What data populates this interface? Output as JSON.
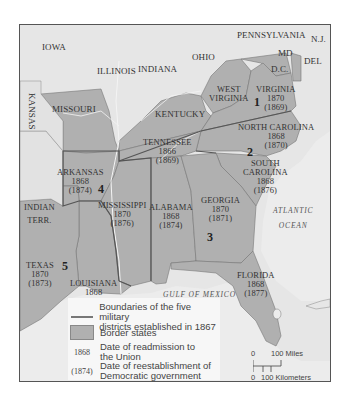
{
  "map": {
    "colors": {
      "border_state_fill": "#b0b0b0",
      "other_state_fill": "#e6e6e6",
      "water": "#ececec",
      "district_boundary": "#555555",
      "river": "#f4f4f4"
    },
    "states": [
      {
        "name": "IOWA"
      },
      {
        "name": "ILLINOIS"
      },
      {
        "name": "INDIANA"
      },
      {
        "name": "OHIO"
      },
      {
        "name": "PENNSYLVANIA"
      },
      {
        "name": "N.J."
      },
      {
        "name": "MD"
      },
      {
        "name": "D.C."
      },
      {
        "name": "DEL"
      },
      {
        "name": "KANSAS"
      },
      {
        "name": "MISSOURI"
      },
      {
        "name": "KENTUCKY"
      },
      {
        "name": "WEST VIRGINIA"
      },
      {
        "name": "INDIAN TERR."
      },
      {
        "name": "VIRGINIA",
        "readmission": "1870",
        "democratic": "(1869)"
      },
      {
        "name": "NORTH CAROLINA",
        "readmission": "1868",
        "democratic": "(1870)"
      },
      {
        "name": "TENNESSEE",
        "readmission": "1866",
        "democratic": "(1869)"
      },
      {
        "name": "SOUTH CAROLINA",
        "readmission": "1868",
        "democratic": "(1876)"
      },
      {
        "name": "ARKANSAS",
        "readmission": "1868",
        "democratic": "(1874)"
      },
      {
        "name": "MISSISSIPPI",
        "readmission": "1870",
        "democratic": "(1876)"
      },
      {
        "name": "ALABAMA",
        "readmission": "1868",
        "democratic": "(1874)"
      },
      {
        "name": "GEORGIA",
        "readmission": "1870",
        "democratic": "(1871)"
      },
      {
        "name": "TEXAS",
        "readmission": "1870",
        "democratic": "(1873)"
      },
      {
        "name": "LOUISIANA",
        "readmission": "1868",
        "democratic": "(1877)"
      },
      {
        "name": "FLORIDA",
        "readmission": "1868",
        "democratic": "(1877)"
      }
    ],
    "labels": {
      "iowa": "IOWA",
      "illinois": "ILLINOIS",
      "indiana": "INDIANA",
      "ohio": "OHIO",
      "pennsylvania": "PENNSYLVANIA",
      "nj": "N.J.",
      "md": "MD",
      "dc": "D.C.",
      "del": "DEL",
      "kansas": "KANSAS",
      "missouri": "MISSOURI",
      "kentucky": "KENTUCKY",
      "west_virginia_1": "WEST",
      "west_virginia_2": "VIRGINIA",
      "indian_terr_1": "INDIAN",
      "indian_terr_2": "TERR.",
      "virginia": "VIRGINIA",
      "virginia_r": "1870",
      "virginia_d": "(1869)",
      "north_carolina": "NORTH CAROLINA",
      "north_carolina_r": "1868",
      "north_carolina_d": "(1870)",
      "tennessee": "TENNESSEE",
      "tennessee_r": "1866",
      "tennessee_d": "(1869)",
      "south_carolina_1": "SOUTH",
      "south_carolina_2": "CAROLINA",
      "south_carolina_r": "1868",
      "south_carolina_d": "(1876)",
      "arkansas": "ARKANSAS",
      "arkansas_r": "1868",
      "arkansas_d": "(1874)",
      "mississippi": "MISSISSIPPI",
      "mississippi_r": "1870",
      "mississippi_d": "(1876)",
      "alabama": "ALABAMA",
      "alabama_r": "1868",
      "alabama_d": "(1874)",
      "georgia": "GEORGIA",
      "georgia_r": "1870",
      "georgia_d": "(1871)",
      "texas": "TEXAS",
      "texas_r": "1870",
      "texas_d": "(1873)",
      "louisiana": "LOUISIANA",
      "louisiana_r": "1868",
      "louisiana_d": "(1877)",
      "florida": "FLORIDA",
      "florida_r": "1868",
      "florida_d": "(1877)"
    },
    "districts": [
      "1",
      "2",
      "3",
      "4",
      "5"
    ],
    "water_bodies": {
      "atlantic_1": "ATLANTIC",
      "atlantic_2": "OCEAN",
      "gulf": "GULF OF MEXICO"
    }
  },
  "legend": {
    "items": [
      {
        "key": "line",
        "text_1": "Boundaries of the five military",
        "text_2": "districts established in 1867"
      },
      {
        "key": "swatch",
        "text_1": "Border states"
      },
      {
        "key": "1868",
        "text_1": "Date of readmission to",
        "text_2": "the Union"
      },
      {
        "key": "(1874)",
        "text_1": "Date of reestablishment of",
        "text_2": "Democratic government"
      }
    ]
  },
  "scale": {
    "zero_top": "0",
    "miles": "100 Miles",
    "zero_bottom": "0",
    "kilometers": "100 Kilometers"
  }
}
